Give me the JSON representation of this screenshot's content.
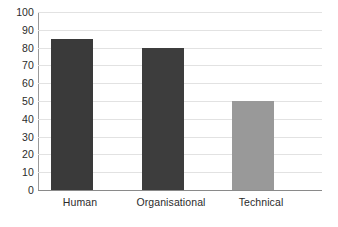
{
  "chart_data": {
    "type": "bar",
    "title": "",
    "subtitle": "",
    "xlabel": "",
    "ylabel": "",
    "categories": [
      "Human",
      "Organisational",
      "Technical"
    ],
    "values": [
      85,
      80,
      50
    ],
    "series": [
      {
        "name": "",
        "values": [
          85,
          80,
          50
        ]
      }
    ],
    "ylim": [
      0,
      100
    ],
    "y_ticks": [
      100,
      90,
      80,
      70,
      60,
      50,
      40,
      30,
      20,
      10,
      0
    ],
    "y_tick_labels": [
      "100",
      "90",
      "80",
      "70",
      "60",
      "50",
      "40",
      "30",
      "20",
      "10",
      "0"
    ],
    "grid": true,
    "grid_axis": "y",
    "legend": false,
    "legend_position": "none",
    "bar_colors": [
      "#3a3a3a",
      "#3d3d3d",
      "#999999"
    ],
    "colors": {
      "gridline": "#e2e2e2",
      "axis_line": "#9a9a9a",
      "baseline": "#8a8a8a",
      "tick_text": "#2b2b2b",
      "background": "#ffffff"
    },
    "annotations": []
  }
}
